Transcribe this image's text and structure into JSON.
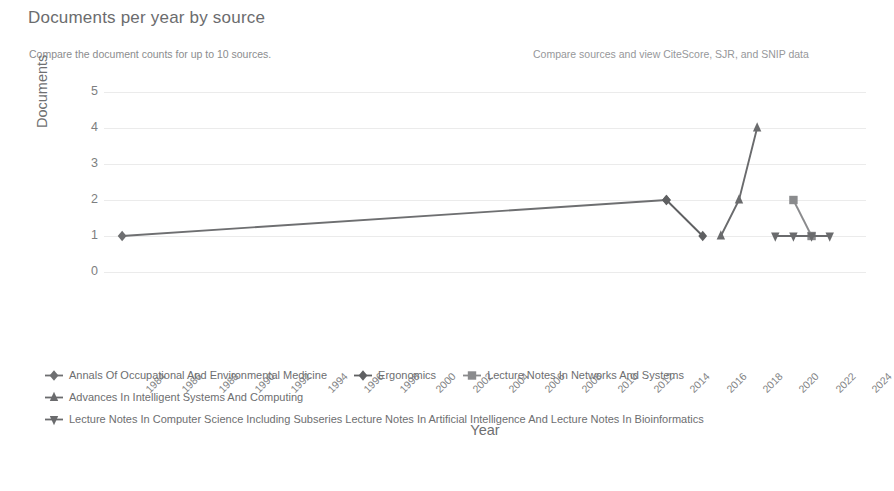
{
  "header": {
    "title": "Documents per year by source",
    "subtitle": "Compare the document counts for up to 10 sources.",
    "right_link": "Compare sources and view CiteScore, SJR, and SNIP data"
  },
  "chart_data": {
    "type": "line",
    "title": "Documents per year by source",
    "xlabel": "Year",
    "ylabel": "Documents",
    "x": [
      1984,
      1986,
      1988,
      1990,
      1992,
      1994,
      1996,
      1998,
      2000,
      2002,
      2004,
      2006,
      2008,
      2010,
      2012,
      2014,
      2016,
      2018,
      2020,
      2022,
      2024
    ],
    "xtick_labels": [
      "1984",
      "1986",
      "1988",
      "1990",
      "1992",
      "1994",
      "1996",
      "1998",
      "2000",
      "2002",
      "2004",
      "2006",
      "2008",
      "2010",
      "2012",
      "2014",
      "2016",
      "2018",
      "2020",
      "2022",
      "2024"
    ],
    "xlim": [
      1983,
      2025
    ],
    "ylim": [
      0,
      5
    ],
    "ytick_labels": [
      "0",
      "1",
      "2",
      "3",
      "4",
      "5"
    ],
    "grid": "horizontal",
    "legend_position": "bottom-left",
    "series": [
      {
        "name": "Annals Of Occupational And Environmental Medicine",
        "marker": "diamond",
        "color": "#6e6f71",
        "points": [
          [
            1984,
            1
          ],
          [
            2014,
            2
          ]
        ]
      },
      {
        "name": "Ergonomics",
        "marker": "diamond",
        "color": "#5f6062",
        "points": [
          [
            2014,
            2
          ],
          [
            2016,
            1
          ]
        ]
      },
      {
        "name": "Lecture Notes In Networks And Systems",
        "marker": "square",
        "color": "#8a8b8d",
        "points": [
          [
            2021,
            2
          ],
          [
            2022,
            1
          ]
        ]
      },
      {
        "name": "Advances In Intelligent Systems And Computing",
        "marker": "triangle-up",
        "color": "#6a6b6d",
        "points": [
          [
            2017,
            1
          ],
          [
            2018,
            2
          ],
          [
            2019,
            4
          ]
        ]
      },
      {
        "name": "Lecture Notes In Computer Science Including Subseries Lecture Notes In Artificial Intelligence And Lecture Notes In Bioinformatics",
        "marker": "triangle-down",
        "color": "#6a6b6d",
        "points": [
          [
            2020,
            1
          ],
          [
            2021,
            1
          ],
          [
            2022,
            1
          ],
          [
            2023,
            1
          ]
        ]
      }
    ]
  },
  "legend_rows": [
    [
      "Annals Of Occupational And Environmental Medicine",
      "Ergonomics",
      "Lecture Notes In Networks And Systems"
    ],
    [
      "Advances In Intelligent Systems And Computing"
    ],
    [
      "Lecture Notes In Computer Science Including Subseries Lecture Notes In Artificial Intelligence And Lecture Notes In Bioinformatics"
    ]
  ]
}
